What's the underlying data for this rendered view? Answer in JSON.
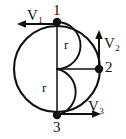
{
  "figure": {
    "type": "physics-diagram",
    "background_color": "#ffffff",
    "stroke_color": "#111111",
    "width": 126,
    "height": 139
  },
  "geometry": {
    "main_circle": {
      "center_x": 57,
      "center_y": 69,
      "radius": 43
    },
    "inner_arcs": [
      {
        "name": "upper-semicircle",
        "from_point": "1",
        "to_point": "center",
        "radius": 21.5,
        "bulge": "right"
      },
      {
        "name": "lower-semicircle",
        "from_point": "center",
        "to_point": "3",
        "radius": 21.5,
        "bulge": "right"
      }
    ],
    "radius_line": {
      "name": "horizontal-radius",
      "from_x": 57,
      "from_y": 69,
      "to_x": 99,
      "to_y": 69
    },
    "vertical_diameter": {
      "from_x": 57,
      "from_y": 22,
      "to_x": 57,
      "to_y": 115
    }
  },
  "points": [
    {
      "id": "point-1",
      "label": "1",
      "x": 57,
      "y": 22,
      "position": "top"
    },
    {
      "id": "point-2",
      "label": "2",
      "x": 99,
      "y": 69,
      "position": "right"
    },
    {
      "id": "point-3",
      "label": "3",
      "x": 57,
      "y": 115,
      "position": "bottom"
    }
  ],
  "radius_labels": [
    {
      "id": "r-upper",
      "label": "r",
      "x": 64,
      "y": 38
    },
    {
      "id": "r-lower",
      "label": "r",
      "x": 42,
      "y": 81
    }
  ],
  "vectors": [
    {
      "id": "v1",
      "symbol": "V",
      "subscript": "1",
      "label": "V1",
      "direction": "left",
      "origin_point": "1",
      "tail_x": 57,
      "tail_y": 24,
      "tip_x": 19,
      "tip_y": 24
    },
    {
      "id": "v2",
      "symbol": "V",
      "subscript": "2",
      "label": "V2",
      "direction": "up",
      "origin_point": "2",
      "tail_x": 99,
      "tail_y": 69,
      "tip_x": 99,
      "tip_y": 32
    },
    {
      "id": "v3",
      "symbol": "V",
      "subscript": "3",
      "label": "V3",
      "direction": "right",
      "origin_point": "3",
      "tail_x": 57,
      "tail_y": 114,
      "tip_x": 99,
      "tip_y": 114
    }
  ]
}
